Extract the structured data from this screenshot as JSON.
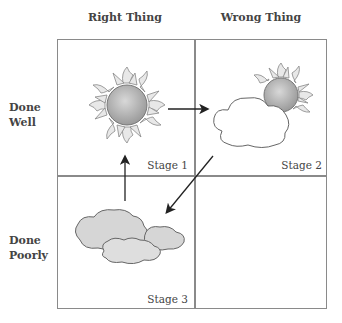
{
  "columns": [
    {
      "label": "Right Thing"
    },
    {
      "label": "Wrong Thing"
    }
  ],
  "rows": [
    {
      "label_line1": "Done",
      "label_line2": "Well"
    },
    {
      "label_line1": "Done",
      "label_line2": "Poorly"
    }
  ],
  "cells": [
    {
      "position": "top-left",
      "stage": "Stage 1",
      "icon": "sun-icon"
    },
    {
      "position": "top-right",
      "stage": "Stage 2",
      "icon": "sun-behind-cloud-icon"
    },
    {
      "position": "bottom-left",
      "stage": "Stage 3",
      "icon": "clouds-icon"
    },
    {
      "position": "bottom-right",
      "stage": "",
      "icon": ""
    }
  ],
  "arrows": [
    {
      "from": "Stage 1",
      "to": "Stage 2",
      "direction": "right"
    },
    {
      "from": "Stage 2",
      "to": "Stage 3",
      "direction": "down-left"
    },
    {
      "from": "Stage 3",
      "to": "Stage 1",
      "direction": "up"
    }
  ],
  "colors": {
    "grid_line": "#8a8a8a",
    "sun_fill": "#b8b8b8",
    "cloud_fill_light": "#ffffff",
    "cloud_fill_gray": "#d6d6d6",
    "arrow": "#222222"
  }
}
